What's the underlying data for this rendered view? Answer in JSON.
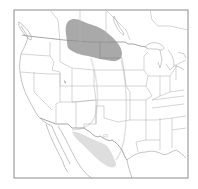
{
  "map": {
    "title": "",
    "region": "North America (United States, southern Canada, northern Mexico)",
    "colors": {
      "background": "#ffffff",
      "frame": "#8c8c8c",
      "borders": "#b9b9b9",
      "breeding_range": "#a9a9a9",
      "winter_range": "#dedede",
      "migration_outline": "#e4e4e4"
    },
    "layers": [
      {
        "name": "breeding-range",
        "description": "Dark gray region across southern Prairie Provinces and northern Great Plains"
      },
      {
        "name": "winter-range",
        "description": "Light gray region in northern Mexico east of the Sierra Madre / west Texas"
      },
      {
        "name": "migration-route",
        "description": "Faint outline connecting breeding and winter ranges through the Great Plains"
      }
    ],
    "label_small": "(2)"
  }
}
